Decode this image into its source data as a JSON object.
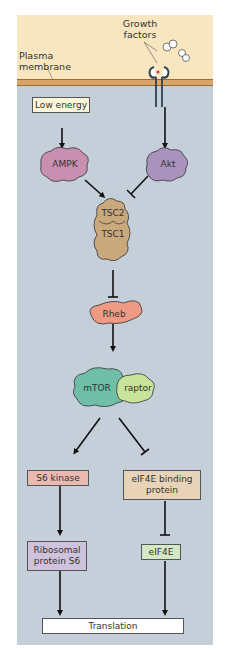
{
  "labels": {
    "growth_factors": "Growth factors",
    "plasma_membrane": "Plasma membrane"
  },
  "nodes": {
    "low_energy": "Low energy",
    "ampk": "AMPK",
    "akt": "Akt",
    "tsc2": "TSC2",
    "tsc1": "TSC1",
    "rheb": "Rheb",
    "mtor": "mTOR",
    "raptor": "raptor",
    "s6_kinase": "S6 kinase",
    "eif4e_bp": "eIF4E binding protein",
    "ribosomal_s6": "Ribosomal protein S6",
    "eif4e": "eIF4E",
    "translation": "Translation"
  },
  "edges": [
    {
      "from": "low_energy",
      "to": "ampk",
      "type": "activate"
    },
    {
      "from": "growth_factors",
      "to": "akt",
      "type": "activate"
    },
    {
      "from": "ampk",
      "to": "tsc",
      "type": "activate"
    },
    {
      "from": "akt",
      "to": "tsc",
      "type": "inhibit"
    },
    {
      "from": "tsc",
      "to": "rheb",
      "type": "inhibit"
    },
    {
      "from": "rheb",
      "to": "mtor",
      "type": "activate"
    },
    {
      "from": "mtor",
      "to": "s6_kinase",
      "type": "activate"
    },
    {
      "from": "mtor",
      "to": "eif4e_bp",
      "type": "inhibit"
    },
    {
      "from": "s6_kinase",
      "to": "ribosomal_s6",
      "type": "activate"
    },
    {
      "from": "eif4e_bp",
      "to": "eif4e",
      "type": "inhibit"
    },
    {
      "from": "ribosomal_s6",
      "to": "translation",
      "type": "activate"
    },
    {
      "from": "eif4e",
      "to": "translation",
      "type": "activate"
    }
  ],
  "colors": {
    "cytoplasm": "#c4cfd9",
    "extracellular": "#f7e6bf",
    "membrane": "#d9a467",
    "ampk": "#c98fb0",
    "akt": "#a993bd",
    "tsc": "#c9a87c",
    "rheb": "#ee9a84",
    "mtor": "#6fbfa8",
    "raptor": "#c8e39a",
    "s6_kinase": "#eabab0",
    "eif4e_bp": "#e8d3b8",
    "ribosomal_s6": "#cfc2dc",
    "eif4e": "#d3e8c4",
    "low_energy": "#fbf6d9",
    "translation": "#ffffff"
  }
}
